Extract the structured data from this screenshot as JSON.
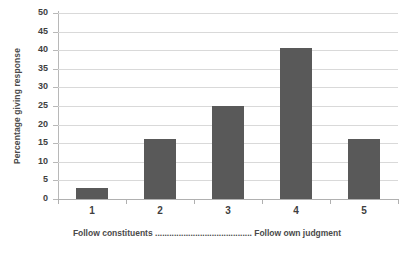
{
  "chart_data": {
    "type": "bar",
    "title": "",
    "subtitle": "",
    "categories": [
      "1",
      "2",
      "3",
      "4",
      "5"
    ],
    "values": [
      3,
      16,
      25,
      40.5,
      16
    ],
    "xlabel": "Follow constituents ......................................... Follow own judgment",
    "ylabel": "Percentage giving response",
    "ylim": [
      0,
      50
    ],
    "ytick_step": 5,
    "yticks": [
      0,
      5,
      10,
      15,
      20,
      25,
      30,
      35,
      40,
      45,
      50
    ],
    "ytick_labels": [
      "0",
      "5",
      "10",
      "15",
      "20",
      "25",
      "30",
      "35",
      "40",
      "45",
      "50"
    ],
    "grid": true,
    "grid_axis": "y",
    "legend": false,
    "legend_position": "none",
    "series": [
      {
        "name": "Percentage giving response",
        "values": [
          3,
          16,
          25,
          40.5,
          16
        ]
      }
    ],
    "colors": {
      "bar_fill": "#595959",
      "gridline": "#d9d9d9",
      "axis_line": "#b0b0b0",
      "text": "#3f3f3f",
      "background": "#ffffff"
    }
  },
  "caption": {
    "left_anchor": "Follow constituents",
    "dots": ".........................................",
    "right_anchor": "Follow own judgment"
  }
}
